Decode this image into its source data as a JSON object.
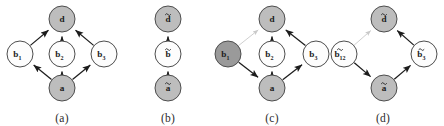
{
  "figure": {
    "width": 444,
    "height": 126,
    "background_color": "#ffffff",
    "style": {
      "node_fill_shaded": "#bdbdbd",
      "node_fill_dark": "#9a9a9a",
      "node_fill_white": "#fdfdfd",
      "node_stroke": "#4d4d4d",
      "edge_color": "#1c1c1c",
      "edge_faint_color": "#c9c9c9",
      "label_color": "#1c1c1c",
      "caption_color": "#2b2b2b"
    }
  },
  "panels": [
    {
      "id": "panel-a",
      "caption": "(a)",
      "nodes": [
        {
          "id": "d",
          "label": "d",
          "sub": "",
          "accent": "none",
          "shade": "shaded",
          "x": 62,
          "y": 19
        },
        {
          "id": "b1",
          "label": "b",
          "sub": "1",
          "accent": "none",
          "shade": "white",
          "x": 20,
          "y": 54
        },
        {
          "id": "b2",
          "label": "b",
          "sub": "2",
          "accent": "none",
          "shade": "white",
          "x": 62,
          "y": 54
        },
        {
          "id": "b3",
          "label": "b",
          "sub": "3",
          "accent": "none",
          "shade": "white",
          "x": 104,
          "y": 54
        },
        {
          "id": "a",
          "label": "a",
          "sub": "",
          "accent": "none",
          "shade": "shaded",
          "x": 62,
          "y": 88
        }
      ],
      "edges": [
        {
          "from": "b1",
          "to": "d",
          "style": "solid"
        },
        {
          "from": "b2",
          "to": "d",
          "style": "solid"
        },
        {
          "from": "b3",
          "to": "d",
          "style": "solid"
        },
        {
          "from": "a",
          "to": "b1",
          "style": "solid"
        },
        {
          "from": "a",
          "to": "b2",
          "style": "solid"
        },
        {
          "from": "a",
          "to": "b3",
          "style": "solid"
        }
      ]
    },
    {
      "id": "panel-b",
      "caption": "(b)",
      "nodes": [
        {
          "id": "dt",
          "label": "d",
          "sub": "",
          "accent": "tilde",
          "shade": "shaded",
          "x": 52,
          "y": 19
        },
        {
          "id": "bt",
          "label": "b",
          "sub": "",
          "accent": "tilde",
          "shade": "white",
          "x": 52,
          "y": 54
        },
        {
          "id": "at",
          "label": "a",
          "sub": "",
          "accent": "tilde",
          "shade": "shaded",
          "x": 52,
          "y": 88
        }
      ],
      "edges": [
        {
          "from": "bt",
          "to": "dt",
          "style": "solid"
        },
        {
          "from": "at",
          "to": "bt",
          "style": "solid"
        }
      ]
    },
    {
      "id": "panel-c",
      "caption": "(c)",
      "nodes": [
        {
          "id": "d",
          "label": "d",
          "sub": "",
          "accent": "none",
          "shade": "shaded",
          "x": 66,
          "y": 19
        },
        {
          "id": "b1",
          "label": "b",
          "sub": "1",
          "accent": "none",
          "shade": "dark",
          "x": 22,
          "y": 54
        },
        {
          "id": "b2",
          "label": "b",
          "sub": "2",
          "accent": "none",
          "shade": "white",
          "x": 66,
          "y": 54
        },
        {
          "id": "b3",
          "label": "b",
          "sub": "3",
          "accent": "none",
          "shade": "white",
          "x": 110,
          "y": 54
        },
        {
          "id": "a",
          "label": "a",
          "sub": "",
          "accent": "none",
          "shade": "shaded",
          "x": 66,
          "y": 88
        }
      ],
      "edges": [
        {
          "from": "b1",
          "to": "d",
          "style": "faint"
        },
        {
          "from": "b2",
          "to": "d",
          "style": "solid"
        },
        {
          "from": "b3",
          "to": "d",
          "style": "solid"
        },
        {
          "from": "b1",
          "to": "a",
          "style": "solid"
        },
        {
          "from": "a",
          "to": "b2",
          "style": "solid"
        },
        {
          "from": "a",
          "to": "b3",
          "style": "solid"
        }
      ]
    },
    {
      "id": "panel-d",
      "caption": "(d)",
      "nodes": [
        {
          "id": "dt",
          "label": "d",
          "sub": "",
          "accent": "tilde",
          "shade": "shaded",
          "x": 62,
          "y": 19
        },
        {
          "id": "b12t",
          "label": "b",
          "sub": "12",
          "accent": "tilde",
          "shade": "white",
          "x": 22,
          "y": 54
        },
        {
          "id": "b3t",
          "label": "b",
          "sub": "3",
          "accent": "tilde",
          "shade": "white",
          "x": 102,
          "y": 54
        },
        {
          "id": "at",
          "label": "a",
          "sub": "",
          "accent": "tilde",
          "shade": "shaded",
          "x": 62,
          "y": 88
        }
      ],
      "edges": [
        {
          "from": "b12t",
          "to": "dt",
          "style": "faint"
        },
        {
          "from": "b3t",
          "to": "dt",
          "style": "solid"
        },
        {
          "from": "b12t",
          "to": "at",
          "style": "solid"
        },
        {
          "from": "at",
          "to": "b3t",
          "style": "solid"
        }
      ]
    }
  ],
  "panel_layout": [
    {
      "id": "panel-a",
      "left": 0,
      "width": 124
    },
    {
      "id": "panel-b",
      "left": 116,
      "width": 104
    },
    {
      "id": "panel-c",
      "left": 206,
      "width": 132
    },
    {
      "id": "panel-d",
      "left": 322,
      "width": 122
    }
  ]
}
